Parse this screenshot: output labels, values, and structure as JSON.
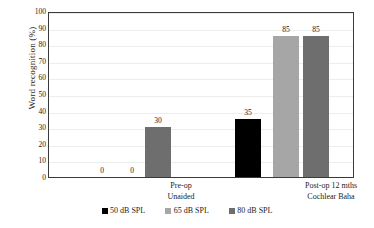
{
  "chart_data": {
    "type": "bar",
    "title": "",
    "subtitle": "",
    "xlabel": "",
    "ylabel": "Word recognition (%)",
    "ylim": [
      0,
      100
    ],
    "ytick_step": 10,
    "ytick_labels": [
      "100",
      "90",
      "80",
      "70",
      "60",
      "50",
      "40",
      "30",
      "20",
      "10",
      "0"
    ],
    "grid": "horizontal",
    "legend_position": "bottom-center",
    "categories": [
      "Pre-op\nUnaided",
      "Post-op 12 mths\nCochlear Baha"
    ],
    "category_lines": [
      [
        "Pre-op",
        "Unaided"
      ],
      [
        "Post-op 12 mths",
        "Cochlear Baha"
      ]
    ],
    "series": [
      {
        "name": "50 dB SPL",
        "color": "#000000",
        "values": [
          0,
          35
        ],
        "labels": [
          "0",
          "35"
        ]
      },
      {
        "name": "65 dB SPL",
        "color": "#a6a6a6",
        "values": [
          0,
          85
        ],
        "labels": [
          "0",
          "85"
        ]
      },
      {
        "name": "80 dB SPL",
        "color": "#6e6e6e",
        "values": [
          30,
          85
        ],
        "labels": [
          "30",
          "85"
        ]
      }
    ],
    "bars": [
      {
        "group": 0,
        "series": 0,
        "name": "50 dB SPL",
        "value": 0,
        "label": "0",
        "color": "#000000",
        "x": 40,
        "width": 26
      },
      {
        "group": 0,
        "series": 1,
        "name": "65 dB SPL",
        "value": 0,
        "label": "0",
        "color": "#a6a6a6",
        "x": 70,
        "width": 26
      },
      {
        "group": 0,
        "series": 2,
        "name": "80 dB SPL",
        "value": 30,
        "label": "30",
        "color": "#6e6e6e",
        "x": 96,
        "width": 26
      },
      {
        "group": 1,
        "series": 0,
        "name": "50 dB SPL",
        "value": 35,
        "label": "35",
        "color": "#000000",
        "x": 186,
        "width": 26
      },
      {
        "group": 1,
        "series": 1,
        "name": "65 dB SPL",
        "value": 85,
        "label": "85",
        "color": "#a6a6a6",
        "x": 224,
        "width": 26
      },
      {
        "group": 1,
        "series": 2,
        "name": "80 dB SPL",
        "value": 85,
        "label": "85",
        "color": "#6e6e6e",
        "x": 254,
        "width": 26
      }
    ],
    "category_label_positions": [
      {
        "left": 88,
        "width": 90
      },
      {
        "left": 228,
        "width": 110
      }
    ],
    "colors": {
      "plot_border": "#3a3a3a",
      "gridline": "#ededed",
      "background": "#ffffff",
      "text": "#1c1c1c"
    }
  },
  "legend": {
    "items": [
      {
        "label": "50 dB SPL",
        "color": "#000000"
      },
      {
        "label": "65 dB SPL",
        "color": "#a6a6a6"
      },
      {
        "label": "80 dB SPL",
        "color": "#6e6e6e"
      }
    ]
  }
}
